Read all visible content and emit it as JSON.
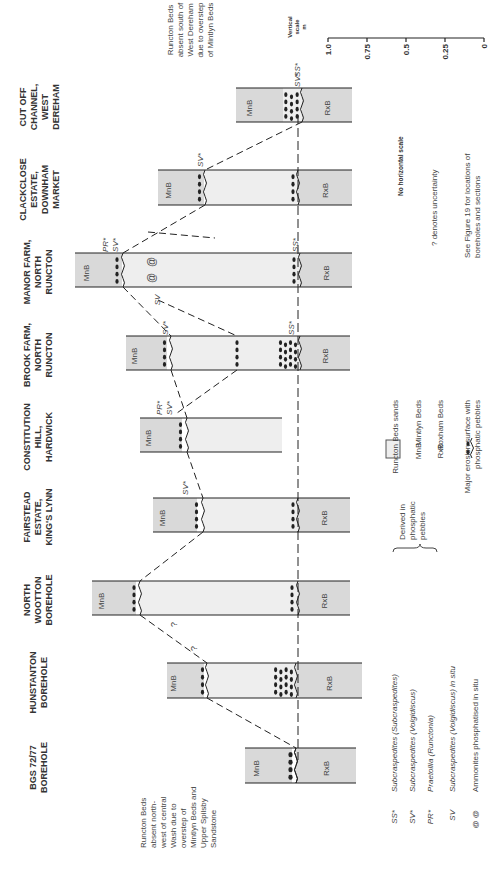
{
  "figure": {
    "orientation": "rotated-90-ccw",
    "colors": {
      "runcton_sands": "#eeeeee",
      "mintlyn_rxb_fill": "#d9d9d9",
      "line": "#222222",
      "text": "#444444"
    }
  },
  "columns": [
    {
      "id": "cut-off-channel",
      "title": [
        "CUT OFF",
        "CHANNEL,",
        "WEST",
        "DEREHAM"
      ],
      "band_y": [
        88,
        122
      ],
      "mnb": [
        236,
        283
      ],
      "pebbles": [
        283,
        302
      ],
      "runcton": null,
      "rxb": [
        302,
        352
      ],
      "erosion_x": 302,
      "labels": [
        {
          "text": "SV*",
          "x": 300,
          "y": 80
        },
        {
          "text": "SS*",
          "x": 300,
          "y": 70
        }
      ],
      "mnb_label": "MnB",
      "rxb_label": "RxB"
    },
    {
      "id": "clackclose",
      "title": [
        "CLACKCLOSE",
        "ESTATE,",
        "DOWNHAM",
        "MARKET"
      ],
      "band_y": [
        170,
        205
      ],
      "mnb": [
        158,
        200
      ],
      "pebbles_mnb": [
        196,
        205
      ],
      "runcton": [
        205,
        298
      ],
      "rxb": [
        298,
        352
      ],
      "pebbles_rxb": [
        290,
        298
      ],
      "erosion_x": 205,
      "labels": [
        {
          "text": "SV*",
          "x": 203,
          "y": 160
        }
      ],
      "mnb_label": "MnB",
      "rxb_label": "RxB"
    },
    {
      "id": "manor-farm",
      "title": [
        "MANOR FARM,",
        "NORTH",
        "RUNCTON"
      ],
      "band_y": [
        253,
        287
      ],
      "mnb": [
        75,
        118
      ],
      "pebbles_mnb": [
        113,
        123
      ],
      "runcton": [
        123,
        300
      ],
      "rxb": [
        300,
        352
      ],
      "pebbles_rxb": [
        290,
        300
      ],
      "erosion_x": 123,
      "labels": [
        {
          "text": "PR*",
          "x": 108,
          "y": 245
        },
        {
          "text": "SV*",
          "x": 118,
          "y": 245
        },
        {
          "text": "SS*",
          "x": 298,
          "y": 245
        },
        {
          "text": "SV",
          "x": 160,
          "y": 300
        }
      ],
      "ammonites": [
        {
          "x": 155,
          "y": 262
        },
        {
          "x": 155,
          "y": 278
        }
      ],
      "mnb_label": "MnB",
      "rxb_label": "RxB"
    },
    {
      "id": "brook-farm",
      "title": [
        "BROOK FARM,",
        "NORTH",
        "RUNCTON"
      ],
      "band_y": [
        336,
        370
      ],
      "mnb": [
        126,
        163
      ],
      "pebbles_mnb": [
        160,
        171
      ],
      "runcton": [
        171,
        300
      ],
      "rxb": [
        300,
        350
      ],
      "pebbles_rxb": [
        278,
        300
      ],
      "pebbles_mid": 237,
      "erosion_x": 171,
      "labels": [
        {
          "text": "SV*",
          "x": 168,
          "y": 328
        },
        {
          "text": "SS*",
          "x": 294,
          "y": 328
        }
      ],
      "mnb_label": "MnB",
      "rxb_label": "RxB"
    },
    {
      "id": "constitution-hill",
      "title": [
        "CONSTITUTION",
        "HILL,",
        "HARDWICK"
      ],
      "band_y": [
        418,
        452
      ],
      "mnb": [
        140,
        178
      ],
      "pebbles_mnb": [
        176,
        187
      ],
      "runcton": [
        187,
        282
      ],
      "rxb": null,
      "erosion_x": 187,
      "labels": [
        {
          "text": "PR*",
          "x": 162,
          "y": 408
        },
        {
          "text": "SV*",
          "x": 172,
          "y": 408
        }
      ],
      "mnb_label": "MnB",
      "rxb_label": null
    },
    {
      "id": "fairstead",
      "title": [
        "FAIRSTEAD",
        "ESTATE,",
        "KING'S LYNN"
      ],
      "band_y": [
        498,
        532
      ],
      "mnb": [
        153,
        193
      ],
      "pebbles_mnb": [
        192,
        203
      ],
      "runcton": [
        203,
        298
      ],
      "rxb": [
        298,
        350
      ],
      "pebbles_rxb": [
        290,
        298
      ],
      "erosion_x": 203,
      "labels": [
        {
          "text": "SV*",
          "x": 188,
          "y": 488
        }
      ],
      "mnb_label": "MnB",
      "rxb_label": "RxB"
    },
    {
      "id": "north-wootton",
      "title": [
        "NORTH",
        "WOOTTON",
        "BOREHOLE"
      ],
      "band_y": [
        581,
        615
      ],
      "mnb": [
        92,
        132
      ],
      "pebbles_mnb": [
        130,
        140
      ],
      "runcton": [
        140,
        298
      ],
      "rxb": [
        298,
        350
      ],
      "pebbles_rxb": [
        288,
        298
      ],
      "erosion_x": 140,
      "labels": [],
      "mnb_label": "MnB",
      "rxb_label": "RxB"
    },
    {
      "id": "hunstanton",
      "title": [
        "HUNSTANTON",
        "BOREHOLE"
      ],
      "band_y": [
        663,
        698
      ],
      "mnb": [
        167,
        200
      ],
      "pebbles_mnb": [
        200,
        207
      ],
      "runcton": [
        207,
        296
      ],
      "rxb": [
        296,
        362
      ],
      "pebbles_rxb": [
        273,
        296
      ],
      "erosion_x": 207,
      "labels": [],
      "mnb_label": "MnB",
      "rxb_label": "RxB"
    },
    {
      "id": "bgs-72-77",
      "title": [
        "BGS 72/77",
        "BOREHOLE"
      ],
      "band_y": [
        748,
        783
      ],
      "mnb": [
        245,
        288
      ],
      "pebbles_mnb": [
        288,
        296
      ],
      "runcton": null,
      "rxb": [
        296,
        356
      ],
      "erosion_x": 296,
      "labels": [],
      "mnb_label": "MnB",
      "rxb_label": "RxB"
    }
  ],
  "correlation_lines": [
    {
      "points": [
        [
          302,
          122
        ],
        [
          205,
          170
        ]
      ]
    },
    {
      "points": [
        [
          205,
          205
        ],
        [
          123,
          253
        ]
      ]
    },
    {
      "points": [
        [
          148,
          232
        ],
        [
          215,
          238
        ]
      ]
    },
    {
      "points": [
        [
          123,
          287
        ],
        [
          171,
          336
        ]
      ]
    },
    {
      "points": [
        [
          158,
          300
        ],
        [
          237,
          336
        ]
      ]
    },
    {
      "points": [
        [
          237,
          370
        ],
        [
          177,
          413
        ]
      ]
    },
    {
      "points": [
        [
          171,
          370
        ],
        [
          187,
          418
        ]
      ]
    },
    {
      "points": [
        [
          187,
          452
        ],
        [
          203,
          498
        ]
      ]
    },
    {
      "points": [
        [
          203,
          532
        ],
        [
          140,
          581
        ]
      ]
    },
    {
      "points": [
        [
          140,
          615
        ],
        [
          207,
          663
        ]
      ]
    },
    {
      "points": [
        [
          207,
          698
        ],
        [
          296,
          748
        ]
      ]
    }
  ],
  "question_marks": [
    {
      "x": 177,
      "y": 627
    },
    {
      "x": 197,
      "y": 651
    }
  ],
  "datum_line": {
    "x": 298,
    "y_from": 115,
    "y_to": 760
  },
  "notes": {
    "right_top": [
      "Runcton Beds",
      "absent south of",
      "West Dereham",
      "due to overstep",
      "of Mintlyn Beds"
    ],
    "left_bottom": [
      "Runcton Beds",
      "absent north-",
      "west of central",
      "Wash due to",
      "overstep of",
      "Mintlyn Beds and",
      "Upper Spilsby",
      "Sandstone"
    ]
  },
  "scale": {
    "title": [
      "Vertical",
      "scale",
      "m"
    ],
    "ticks": [
      {
        "label": "1.0",
        "x": 328
      },
      {
        "label": "0.75",
        "x": 367
      },
      {
        "label": "0.5",
        "x": 406
      },
      {
        "label": "0.25",
        "x": 445
      },
      {
        "label": "0",
        "x": 484
      }
    ],
    "axis_y": 38
  },
  "side_notes": {
    "no_horizontal_scale": "No horizontal scale",
    "uncertainty": "? denotes uncertainty",
    "see_figure": [
      "See Figure 19 for locations of",
      "boreholes and sections"
    ]
  },
  "legend": {
    "units": [
      {
        "key": "box",
        "label": "Runcton Beds sands"
      },
      {
        "key": "MnB",
        "label": "Mintlyn Beds"
      },
      {
        "key": "RxB",
        "label": "Roxham Beds"
      },
      {
        "key": "erosion",
        "label": [
          "Major erosion surface with",
          "phosphatic pebbles"
        ]
      }
    ],
    "fossils": [
      {
        "key": "SS*",
        "label": "Subcraspedites (Subcraspedites)"
      },
      {
        "key": "SV*",
        "label": "Subcraspedites (Volgidiscus)"
      },
      {
        "key": "PR*",
        "label": "Praetollia (Runctonia)"
      },
      {
        "key": "SV",
        "label": "Subcraspedites (Volgidiscus) in situ"
      },
      {
        "key": "@ @",
        "label": "Ammonites phosphatised in situ"
      }
    ],
    "brace_note": [
      "Derived in",
      "phosphatic",
      "pebbles"
    ]
  }
}
